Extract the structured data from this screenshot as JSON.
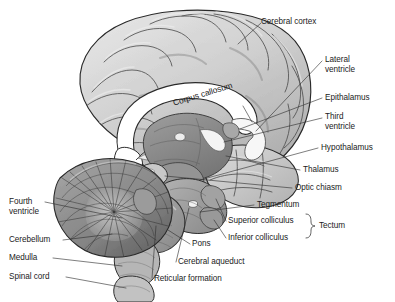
{
  "figure": {
    "type": "anatomical-illustration",
    "view": "midsagittal",
    "style": "grayscale pencil/ink medical illustration",
    "background_color": "#ffffff",
    "ink_color": "#1b1b1b",
    "palette": {
      "cortex_light": "#d6d6d6",
      "cortex_mid": "#b8b8b8",
      "cortex_shadow": "#8f8f8f",
      "outline": "#2a2a2a",
      "corpus_callosum_white": "#ffffff",
      "thalamus_gray": "#8a8a8a",
      "brainstem_gray": "#9a9a9a",
      "cerebellum_gray": "#8c8c8c",
      "cerebellum_dark": "#5e5e5e",
      "leader_line": "#3a3a3a"
    }
  },
  "labels": {
    "cerebral_cortex": "Cerebral cortex",
    "lateral_ventricle_l1": "Lateral",
    "lateral_ventricle_l2": "ventricle",
    "epithalamus": "Epithalamus",
    "third_ventricle_l1": "Third",
    "third_ventricle_l2": "ventricle",
    "hypothalamus": "Hypothalamus",
    "thalamus": "Thalamus",
    "optic_chiasm": "Optic chiasm",
    "tegmentum": "Tegmentum",
    "superior_colliculus": "Superior colliculus",
    "inferior_colliculus": "Inferior colliculus",
    "tectum": "Tectum",
    "corpus_callosum": "Corpus callosum",
    "fourth_ventricle_l1": "Fourth",
    "fourth_ventricle_l2": "ventricle",
    "cerebellum": "Cerebellum",
    "medulla": "Medulla",
    "spinal_cord": "Spinal cord",
    "pons": "Pons",
    "cerebral_aqueduct": "Cerebral aqueduct",
    "reticular_formation": "Reticular formation"
  },
  "callouts": [
    {
      "id": "cerebral-cortex",
      "text": "Cerebral cortex",
      "side": "right",
      "target": "dorsal cortical surface"
    },
    {
      "id": "lateral-ventricle",
      "text": "Lateral ventricle",
      "side": "right",
      "target": "lateral ventricle"
    },
    {
      "id": "epithalamus",
      "text": "Epithalamus",
      "side": "right",
      "target": "epithalamus"
    },
    {
      "id": "third-ventricle",
      "text": "Third ventricle",
      "side": "right",
      "target": "third ventricle"
    },
    {
      "id": "hypothalamus",
      "text": "Hypothalamus",
      "side": "right",
      "target": "hypothalamus"
    },
    {
      "id": "thalamus",
      "text": "Thalamus",
      "side": "right",
      "target": "thalamus"
    },
    {
      "id": "optic-chiasm",
      "text": "Optic chiasm",
      "side": "right",
      "target": "optic chiasm"
    },
    {
      "id": "tegmentum",
      "text": "Tegmentum",
      "side": "right",
      "target": "tegmentum"
    },
    {
      "id": "superior-colliculus",
      "text": "Superior colliculus",
      "side": "right",
      "target": "superior colliculus",
      "grouped_as": "Tectum"
    },
    {
      "id": "inferior-colliculus",
      "text": "Inferior colliculus",
      "side": "right",
      "target": "inferior colliculus",
      "grouped_as": "Tectum"
    },
    {
      "id": "corpus-callosum",
      "text": "Corpus callosum",
      "side": "inline",
      "target": "corpus callosum"
    },
    {
      "id": "fourth-ventricle",
      "text": "Fourth ventricle",
      "side": "left",
      "target": "fourth ventricle"
    },
    {
      "id": "cerebellum",
      "text": "Cerebellum",
      "side": "left",
      "target": "cerebellum"
    },
    {
      "id": "medulla",
      "text": "Medulla",
      "side": "left",
      "target": "medulla oblongata"
    },
    {
      "id": "spinal-cord",
      "text": "Spinal cord",
      "side": "left",
      "target": "spinal cord"
    },
    {
      "id": "pons",
      "text": "Pons",
      "side": "bottom",
      "target": "pons"
    },
    {
      "id": "cerebral-aqueduct",
      "text": "Cerebral aqueduct",
      "side": "bottom",
      "target": "cerebral aqueduct"
    },
    {
      "id": "reticular-formation",
      "text": "Reticular formation",
      "side": "bottom",
      "target": "reticular formation"
    }
  ]
}
